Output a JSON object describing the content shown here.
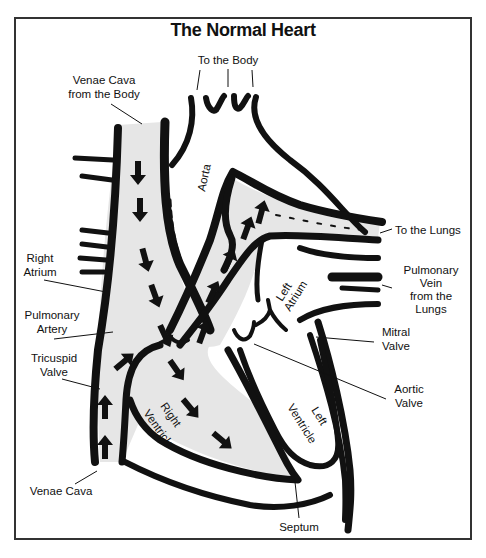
{
  "title": "The Normal Heart",
  "labels": {
    "to_body": "To the Body",
    "venae_cava_from_body_1": "Venae Cava",
    "venae_cava_from_body_2": "from the Body",
    "aorta": "Aorta",
    "to_lungs": "To the Lungs",
    "right_atrium_1": "Right",
    "right_atrium_2": "Atrium",
    "left_atrium_1": "Left",
    "left_atrium_2": "Atrium",
    "pulmonary_vein_1": "Pulmonary",
    "pulmonary_vein_2": "Vein",
    "pulmonary_vein_3": "from the",
    "pulmonary_vein_4": "Lungs",
    "pulmonary_artery_1": "Pulmonary",
    "pulmonary_artery_2": "Artery",
    "mitral_valve_1": "Mitral",
    "mitral_valve_2": "Valve",
    "tricuspid_valve_1": "Tricuspid",
    "tricuspid_valve_2": "Valve",
    "aortic_valve_1": "Aortic",
    "aortic_valve_2": "Valve",
    "right_ventricle_1": "Right",
    "right_ventricle_2": "Ventricle",
    "left_ventricle_1": "Left",
    "left_ventricle_2": "Ventricle",
    "venae_cava": "Venae Cava",
    "septum": "Septum"
  },
  "colors": {
    "ink": "#111111",
    "blood_flow_fill": "#e6e6e6",
    "background": "#ffffff"
  }
}
